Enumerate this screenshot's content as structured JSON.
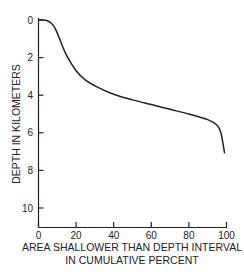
{
  "chart_data": {
    "type": "line",
    "title": "",
    "xlabel": "AREA SHALLOWER THAN DEPTH INTERVAL IN CUMULATIVE PERCENT",
    "xlabel_lines": [
      "AREA SHALLOWER THAN DEPTH INTERVAL",
      "IN CUMULATIVE PERCENT"
    ],
    "ylabel": "DEPTH IN KILOMETERS",
    "xlim": [
      0,
      100
    ],
    "ylim": [
      11,
      0
    ],
    "y_inverted": true,
    "x_ticks": [
      "0",
      "20",
      "40",
      "60",
      "80",
      "100"
    ],
    "y_ticks": [
      "0",
      "2",
      "4",
      "6",
      "8",
      "10"
    ],
    "grid": false,
    "legend": null,
    "series": [
      {
        "name": "Hypsometric curve",
        "x": [
          0,
          5,
          8,
          10,
          12,
          15,
          20,
          25,
          30,
          40,
          50,
          60,
          70,
          80,
          90,
          95,
          97,
          98,
          99
        ],
        "y": [
          0,
          0.05,
          0.3,
          0.7,
          1.2,
          1.9,
          2.7,
          3.2,
          3.5,
          3.95,
          4.25,
          4.5,
          4.75,
          5.0,
          5.3,
          5.6,
          6.0,
          6.5,
          7.1
        ]
      }
    ]
  }
}
